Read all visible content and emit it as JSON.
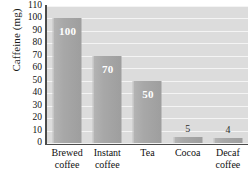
{
  "chart_data": {
    "type": "bar",
    "title": "",
    "xlabel": "",
    "ylabel": "Caffeine (mg)",
    "ylim": [
      0,
      110
    ],
    "ytick_step": 10,
    "yticks": [
      "110",
      "100",
      "90",
      "80",
      "70",
      "60",
      "50",
      "40",
      "30",
      "20",
      "10",
      "0"
    ],
    "categories": [
      "Brewed coffee",
      "Instant coffee",
      "Tea",
      "Cocoa",
      "Decaf coffee"
    ],
    "category_lines": [
      [
        "Brewed",
        "coffee"
      ],
      [
        "Instant",
        "coffee"
      ],
      [
        "Tea"
      ],
      [
        "Cocoa"
      ],
      [
        "Decaf",
        "coffee"
      ]
    ],
    "values": [
      100,
      70,
      50,
      5,
      4
    ],
    "value_labels": [
      "100",
      "70",
      "50",
      "5",
      "4"
    ],
    "label_placement": [
      "inside",
      "inside",
      "inside",
      "above",
      "above"
    ],
    "grid": true,
    "grid_orientation": "horizontal",
    "legend": "none",
    "colors": {
      "plot_background": "#dcdcdc",
      "gridline": "#f4f4f4",
      "bar_fill": "#a8a8a8",
      "axis": "#4a4a4a",
      "inside_label": "#ffffff",
      "above_label": "#2b2b2b",
      "page_background": "#ffffff"
    }
  }
}
